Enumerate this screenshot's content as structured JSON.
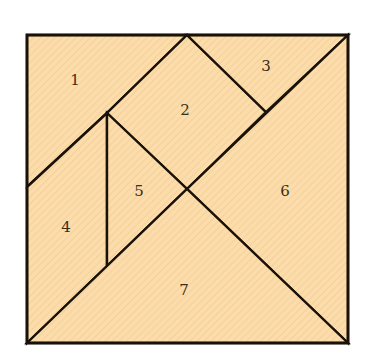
{
  "diagram": {
    "colors": {
      "fill": "#fbdcaa",
      "hatch": "#f3cf96",
      "stroke": "#1a1208",
      "label": "#3a2e1c"
    },
    "frame": {
      "x1": 27,
      "y1": 35,
      "x2": 348,
      "y2": 343
    },
    "pieces": [
      {
        "id": 1,
        "label": "1",
        "shape": "trapezoid",
        "points": "27,35 187,35 107,113 27,187",
        "label_pos": [
          75,
          81
        ]
      },
      {
        "id": 2,
        "label": "2",
        "shape": "square",
        "points": "187,35 266,112 187,189 107,113",
        "label_pos": [
          185,
          111
        ]
      },
      {
        "id": 3,
        "label": "3",
        "shape": "triangle",
        "points": "187,35 348,35 266,112",
        "label_pos": [
          266,
          67
        ]
      },
      {
        "id": 4,
        "label": "4",
        "shape": "trapezoid",
        "points": "27,187 107,113 107,266 27,343",
        "label_pos": [
          66,
          228
        ]
      },
      {
        "id": 5,
        "label": "5",
        "shape": "triangle",
        "points": "107,113 187,189 107,266",
        "label_pos": [
          139,
          192
        ]
      },
      {
        "id": 6,
        "label": "6",
        "shape": "triangle",
        "points": "348,35 348,343 187,189",
        "label_pos": [
          285,
          192
        ]
      },
      {
        "id": 7,
        "label": "7",
        "shape": "triangle",
        "points": "27,343 187,189 348,343",
        "label_pos": [
          184,
          291
        ]
      }
    ]
  }
}
